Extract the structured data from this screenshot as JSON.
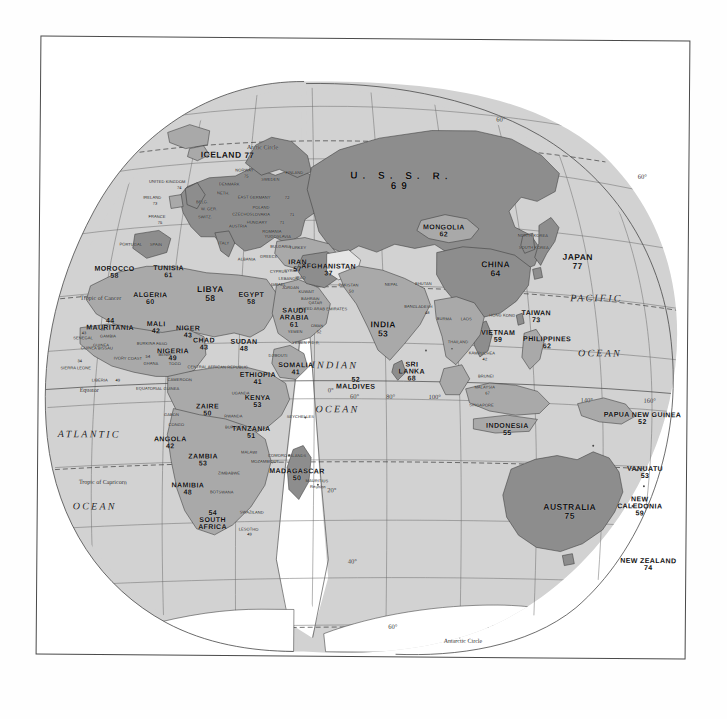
{
  "map": {
    "title": "World map of life expectancy (Eastern Hemisphere, interrupted projection)",
    "projection": "interrupted-homolosine",
    "sea_color": "#d2d2d2",
    "land_light_color": "#c0c0c0",
    "land_dark_color": "#8b8b8b",
    "line_color": "#555555",
    "page_color": "#ffffff"
  },
  "oceans": [
    {
      "name": "ATLANTIC",
      "x": 52,
      "y": 398
    },
    {
      "name": "OCEAN",
      "x": 58,
      "y": 470
    },
    {
      "name": "INDIAN",
      "x": 297,
      "y": 327
    },
    {
      "name": "OCEAN",
      "x": 300,
      "y": 371
    },
    {
      "name": "PACIFIC",
      "x": 558,
      "y": 258
    },
    {
      "name": "OCEAN",
      "x": 562,
      "y": 313
    }
  ],
  "circles": [
    {
      "name": "Tropic of Cancer",
      "x": 42,
      "y": 262
    },
    {
      "name": "Equator",
      "x": 42,
      "y": 354
    },
    {
      "name": "Tropic of Capricorn",
      "x": 42,
      "y": 446
    },
    {
      "name": "Antarctic Circle",
      "x": 408,
      "y": 602
    }
  ],
  "graticule_labels": [
    {
      "text": "60°",
      "x": 461,
      "y": 80
    },
    {
      "text": "60°",
      "x": 603,
      "y": 136
    },
    {
      "text": "40°",
      "x": 657,
      "y": 215
    },
    {
      "text": "20°",
      "x": 694,
      "y": 290
    },
    {
      "text": "180",
      "x": 683,
      "y": 363
    },
    {
      "text": "140°",
      "x": 549,
      "y": 360
    },
    {
      "text": "160°",
      "x": 612,
      "y": 360
    },
    {
      "text": "20°",
      "x": 295,
      "y": 452
    },
    {
      "text": "40°",
      "x": 316,
      "y": 523
    },
    {
      "text": "60°",
      "x": 357,
      "y": 588
    },
    {
      "text": "80°",
      "x": 393,
      "y": 645
    },
    {
      "text": "60°",
      "x": 317,
      "y": 358
    },
    {
      "text": "80°",
      "x": 353,
      "y": 358
    },
    {
      "text": "100°",
      "x": 397,
      "y": 358
    },
    {
      "text": "0°",
      "x": 293,
      "y": 352
    }
  ],
  "countries": [
    {
      "name": "ICELAND",
      "value": "77",
      "x": 188,
      "y": 118,
      "size": "big",
      "inline": true
    },
    {
      "name": "U. S. S. R.",
      "value": "69",
      "x": 362,
      "y": 143,
      "size": "ussr"
    },
    {
      "name": "MONGOLIA",
      "value": "62",
      "x": 405,
      "y": 192,
      "size": "mid"
    },
    {
      "name": "CHINA",
      "value": "64",
      "x": 457,
      "y": 230,
      "size": "big"
    },
    {
      "name": "JAPAN",
      "value": "77",
      "x": 539,
      "y": 222,
      "size": "big"
    },
    {
      "name": "TAIWAN",
      "value": "73",
      "x": 498,
      "y": 277,
      "size": "mid"
    },
    {
      "name": "AFGHANISTAN",
      "value": "37",
      "x": 290,
      "y": 232,
      "size": "mid"
    },
    {
      "name": "IRAN",
      "value": "57",
      "x": 259,
      "y": 228,
      "size": "mid"
    },
    {
      "name": "INDIA",
      "value": "53",
      "x": 345,
      "y": 291,
      "size": "big"
    },
    {
      "name": "SRI LANKA",
      "value": "68",
      "x": 374,
      "y": 333,
      "size": "mid",
      "two": true
    },
    {
      "name": "MALDIVES",
      "value": "52",
      "x": 318,
      "y": 345,
      "size": "mid",
      "rev": true
    },
    {
      "name": "VIETNAM",
      "value": "59",
      "x": 460,
      "y": 297,
      "size": "mid"
    },
    {
      "name": "PHILIPPINES",
      "value": "62",
      "x": 509,
      "y": 303,
      "size": "mid"
    },
    {
      "name": "INDONESIA",
      "value": "55",
      "x": 470,
      "y": 390,
      "size": "mid"
    },
    {
      "name": "PAPUA NEW GUINEA",
      "value": "52",
      "x": 605,
      "y": 378,
      "size": "mid"
    },
    {
      "name": "VANUATU",
      "value": "53",
      "x": 608,
      "y": 432,
      "size": "mid"
    },
    {
      "name": "FIJI",
      "value": "62",
      "x": 673,
      "y": 432,
      "size": "mid",
      "inline": true
    },
    {
      "name": "AUSTRALIA",
      "value": "75",
      "x": 533,
      "y": 472,
      "size": "big"
    },
    {
      "name": "NEW CALEDONIA",
      "value": "59",
      "x": 603,
      "y": 466,
      "size": "mid",
      "two": true
    },
    {
      "name": "NEW ZEALAND",
      "value": "74",
      "x": 612,
      "y": 524,
      "size": "mid"
    },
    {
      "name": "SAUDI ARABIA",
      "value": "61",
      "x": 256,
      "y": 280,
      "size": "mid",
      "two": true
    },
    {
      "name": "EGYPT",
      "value": "58",
      "x": 213,
      "y": 261,
      "size": "mid"
    },
    {
      "name": "LIBYA",
      "value": "58",
      "x": 172,
      "y": 257,
      "size": "big"
    },
    {
      "name": "TUNISIA",
      "value": "61",
      "x": 130,
      "y": 235,
      "size": "mid"
    },
    {
      "name": "MOROCCO",
      "value": "58",
      "x": 76,
      "y": 236,
      "size": "mid"
    },
    {
      "name": "ALGERIA",
      "value": "60",
      "x": 112,
      "y": 262,
      "size": "mid"
    },
    {
      "name": "MAURITANIA",
      "value": "44",
      "x": 72,
      "y": 288,
      "size": "mid",
      "rev": true
    },
    {
      "name": "MALI",
      "value": "42",
      "x": 118,
      "y": 291,
      "size": "mid"
    },
    {
      "name": "NIGER",
      "value": "43",
      "x": 150,
      "y": 295,
      "size": "mid"
    },
    {
      "name": "CHAD",
      "value": "43",
      "x": 166,
      "y": 307,
      "size": "mid"
    },
    {
      "name": "SUDAN",
      "value": "48",
      "x": 206,
      "y": 308,
      "size": "mid"
    },
    {
      "name": "NIGERIA",
      "value": "49",
      "x": 135,
      "y": 318,
      "size": "mid"
    },
    {
      "name": "SOMALIA",
      "value": "41",
      "x": 258,
      "y": 331,
      "size": "mid"
    },
    {
      "name": "ETHIOPIA",
      "value": "41",
      "x": 220,
      "y": 341,
      "size": "mid"
    },
    {
      "name": "KENYA",
      "value": "53",
      "x": 220,
      "y": 364,
      "size": "mid"
    },
    {
      "name": "ZAIRE",
      "value": "50",
      "x": 170,
      "y": 373,
      "size": "mid"
    },
    {
      "name": "TANZANIA",
      "value": "51",
      "x": 214,
      "y": 395,
      "size": "mid"
    },
    {
      "name": "ANGOLA",
      "value": "42",
      "x": 133,
      "y": 406,
      "size": "mid"
    },
    {
      "name": "ZAMBIA",
      "value": "53",
      "x": 166,
      "y": 423,
      "size": "mid"
    },
    {
      "name": "MADAGASCAR",
      "value": "50",
      "x": 260,
      "y": 437,
      "size": "mid"
    },
    {
      "name": "NAMIBIA",
      "value": "48",
      "x": 151,
      "y": 452,
      "size": "mid"
    },
    {
      "name": "SOUTH AFRICA",
      "value": "54",
      "x": 176,
      "y": 483,
      "size": "mid",
      "two": true,
      "rev": true
    }
  ],
  "small_labels": [
    {
      "text": "Arctic Circle",
      "x": 223,
      "y": 110,
      "cls": "circ"
    },
    {
      "text": "NORWAY",
      "x": 205,
      "y": 133,
      "cls": "tiny"
    },
    {
      "text": "75",
      "x": 207,
      "y": 139,
      "cls": "tiny"
    },
    {
      "text": "SWEDEN",
      "x": 231,
      "y": 142,
      "cls": "tiny"
    },
    {
      "text": "FINLAND",
      "x": 255,
      "y": 135,
      "cls": "tiny"
    },
    {
      "text": "UNITED KINGDOM",
      "x": 128,
      "y": 145,
      "cls": "tiny"
    },
    {
      "text": "74",
      "x": 140,
      "y": 151,
      "cls": "tiny"
    },
    {
      "text": "IRELAND",
      "x": 113,
      "y": 161,
      "cls": "tiny"
    },
    {
      "text": "73",
      "x": 116,
      "y": 167,
      "cls": "tiny"
    },
    {
      "text": "DENMARK",
      "x": 190,
      "y": 147,
      "cls": "tiny"
    },
    {
      "text": "NETH.",
      "x": 184,
      "y": 156,
      "cls": "tiny"
    },
    {
      "text": "EAST GERMANY",
      "x": 215,
      "y": 160,
      "cls": "tiny"
    },
    {
      "text": "72",
      "x": 248,
      "y": 160,
      "cls": "tiny"
    },
    {
      "text": "POLAND",
      "x": 222,
      "y": 170,
      "cls": "tiny"
    },
    {
      "text": "CZECHOSLOVAKIA",
      "x": 212,
      "y": 177,
      "cls": "tiny"
    },
    {
      "text": "71",
      "x": 253,
      "y": 177,
      "cls": "tiny"
    },
    {
      "text": "HUNGARY",
      "x": 218,
      "y": 185,
      "cls": "tiny"
    },
    {
      "text": "71",
      "x": 243,
      "y": 185,
      "cls": "tiny"
    },
    {
      "text": "ROMANIA",
      "x": 233,
      "y": 194,
      "cls": "tiny"
    },
    {
      "text": "W. GER.",
      "x": 170,
      "y": 172,
      "cls": "tiny"
    },
    {
      "text": "SWITZ.",
      "x": 166,
      "y": 180,
      "cls": "tiny"
    },
    {
      "text": "BELG.",
      "x": 163,
      "y": 165,
      "cls": "tiny"
    },
    {
      "text": "AUSTRIA",
      "x": 199,
      "y": 189,
      "cls": "tiny"
    },
    {
      "text": "FRANCE",
      "x": 118,
      "y": 180,
      "cls": "tiny"
    },
    {
      "text": "75",
      "x": 121,
      "y": 186,
      "cls": "tiny"
    },
    {
      "text": "PORTUGAL",
      "x": 92,
      "y": 208,
      "cls": "tiny"
    },
    {
      "text": "SPAIN",
      "x": 117,
      "y": 208,
      "cls": "tiny"
    },
    {
      "text": "ITALY",
      "x": 185,
      "y": 206,
      "cls": "tiny"
    },
    {
      "text": "ALBANIA",
      "x": 208,
      "y": 222,
      "cls": "tiny"
    },
    {
      "text": "BULGARIA",
      "x": 242,
      "y": 209,
      "cls": "tiny"
    },
    {
      "text": "YUGOSLAVIA",
      "x": 239,
      "y": 199,
      "cls": "tiny"
    },
    {
      "text": "GREECE",
      "x": 230,
      "y": 219,
      "cls": "tiny"
    },
    {
      "text": "CYPRUS",
      "x": 240,
      "y": 234,
      "cls": "tiny"
    },
    {
      "text": "TURKEY",
      "x": 259,
      "y": 210,
      "cls": "tiny"
    },
    {
      "text": "SYRIA",
      "x": 252,
      "y": 233,
      "cls": "tiny"
    },
    {
      "text": "IRAQ",
      "x": 262,
      "y": 240,
      "cls": "tiny"
    },
    {
      "text": "LEBANON",
      "x": 250,
      "y": 241,
      "cls": "tiny"
    },
    {
      "text": "ISRAEL",
      "x": 240,
      "y": 247,
      "cls": "tiny"
    },
    {
      "text": "JORDAN",
      "x": 252,
      "y": 250,
      "cls": "tiny"
    },
    {
      "text": "KUWAIT",
      "x": 268,
      "y": 254,
      "cls": "tiny"
    },
    {
      "text": "QATAR",
      "x": 277,
      "y": 265,
      "cls": "tiny"
    },
    {
      "text": "BAHRAIN",
      "x": 272,
      "y": 261,
      "cls": "tiny"
    },
    {
      "text": "UNITED ARAB EMIRATES",
      "x": 284,
      "y": 271,
      "cls": "tiny"
    },
    {
      "text": "OMAN",
      "x": 279,
      "y": 288,
      "cls": "tiny"
    },
    {
      "text": "52",
      "x": 281,
      "y": 294,
      "cls": "tiny"
    },
    {
      "text": "YEMEN",
      "x": 257,
      "y": 294,
      "cls": "tiny"
    },
    {
      "text": "YEMEN P.D.R.",
      "x": 268,
      "y": 305,
      "cls": "tiny"
    },
    {
      "text": "DJIBOUTI",
      "x": 240,
      "y": 318,
      "cls": "tiny"
    },
    {
      "text": "PAKISTAN",
      "x": 310,
      "y": 247,
      "cls": "tiny"
    },
    {
      "text": "50",
      "x": 313,
      "y": 253,
      "cls": "tiny"
    },
    {
      "text": "NEPAL",
      "x": 353,
      "y": 246,
      "cls": "tiny"
    },
    {
      "text": "BHUTAN",
      "x": 385,
      "y": 245,
      "cls": "tiny"
    },
    {
      "text": "BANGLADESH",
      "x": 380,
      "y": 268,
      "cls": "tiny"
    },
    {
      "text": "48",
      "x": 389,
      "y": 274,
      "cls": "tiny"
    },
    {
      "text": "BURMA",
      "x": 406,
      "y": 280,
      "cls": "tiny"
    },
    {
      "text": "LAOS",
      "x": 428,
      "y": 280,
      "cls": "tiny"
    },
    {
      "text": "THAILAND",
      "x": 420,
      "y": 303,
      "cls": "tiny"
    },
    {
      "text": "KAMPUCHEA",
      "x": 444,
      "y": 314,
      "cls": "tiny"
    },
    {
      "text": "42",
      "x": 447,
      "y": 320,
      "cls": "tiny"
    },
    {
      "text": "MALAYSIA",
      "x": 447,
      "y": 348,
      "cls": "tiny"
    },
    {
      "text": "67",
      "x": 450,
      "y": 354,
      "cls": "tiny"
    },
    {
      "text": "BRUNEI",
      "x": 448,
      "y": 337,
      "cls": "tiny"
    },
    {
      "text": "SINGAPORE",
      "x": 444,
      "y": 366,
      "cls": "tiny"
    },
    {
      "text": "NORTH KOREA",
      "x": 494,
      "y": 196,
      "cls": "tiny"
    },
    {
      "text": "SOUTH KOREA",
      "x": 495,
      "y": 208,
      "cls": "tiny"
    },
    {
      "text": "HONG KONG",
      "x": 464,
      "y": 276,
      "cls": "tiny"
    },
    {
      "text": "SENEGAL",
      "x": 45,
      "y": 302,
      "cls": "tiny"
    },
    {
      "text": "43",
      "x": 46,
      "y": 297,
      "cls": "tiny"
    },
    {
      "text": "GAMBIA",
      "x": 70,
      "y": 300,
      "cls": "tiny"
    },
    {
      "text": "36",
      "x": 65,
      "y": 293,
      "cls": "tiny"
    },
    {
      "text": "GUINEA BISSAU",
      "x": 59,
      "y": 312,
      "cls": "tiny"
    },
    {
      "text": "GUINEA",
      "x": 63,
      "y": 309,
      "cls": "tiny"
    },
    {
      "text": "SIERRA LEONE",
      "x": 38,
      "y": 332,
      "cls": "tiny"
    },
    {
      "text": "34",
      "x": 42,
      "y": 325,
      "cls": "tiny"
    },
    {
      "text": "LIBERIA",
      "x": 62,
      "y": 344,
      "cls": "tiny"
    },
    {
      "text": "49",
      "x": 80,
      "y": 344,
      "cls": "tiny"
    },
    {
      "text": "IVORY COAST",
      "x": 90,
      "y": 322,
      "cls": "tiny"
    },
    {
      "text": "GHANA",
      "x": 113,
      "y": 327,
      "cls": "tiny"
    },
    {
      "text": "54",
      "x": 110,
      "y": 320,
      "cls": "tiny"
    },
    {
      "text": "BURKINA FASO",
      "x": 114,
      "y": 307,
      "cls": "tiny"
    },
    {
      "text": "BENIN",
      "x": 127,
      "y": 318,
      "cls": "tiny"
    },
    {
      "text": "TOGO",
      "x": 137,
      "y": 327,
      "cls": "tiny"
    },
    {
      "text": "EQUATORIAL GUINEA",
      "x": 120,
      "y": 352,
      "cls": "tiny"
    },
    {
      "text": "CAMEROON",
      "x": 142,
      "y": 343,
      "cls": "tiny"
    },
    {
      "text": "GABON",
      "x": 134,
      "y": 378,
      "cls": "tiny"
    },
    {
      "text": "CONGO",
      "x": 139,
      "y": 388,
      "cls": "tiny"
    },
    {
      "text": "CENTRAL AFRICAN REPUBLIC",
      "x": 180,
      "y": 330,
      "cls": "tiny"
    },
    {
      "text": "UGANDA",
      "x": 203,
      "y": 356,
      "cls": "tiny"
    },
    {
      "text": "RWANDA",
      "x": 196,
      "y": 379,
      "cls": "tiny"
    },
    {
      "text": "BURUNDI",
      "x": 197,
      "y": 390,
      "cls": "tiny"
    },
    {
      "text": "MALAWI",
      "x": 212,
      "y": 415,
      "cls": "tiny"
    },
    {
      "text": "MOZAMBIQUE",
      "x": 228,
      "y": 424,
      "cls": "tiny"
    },
    {
      "text": "ZIMBABWE",
      "x": 192,
      "y": 436,
      "cls": "tiny"
    },
    {
      "text": "BOTSWANA",
      "x": 185,
      "y": 455,
      "cls": "tiny"
    },
    {
      "text": "SWAZILAND",
      "x": 215,
      "y": 475,
      "cls": "tiny"
    },
    {
      "text": "LESOTHO",
      "x": 212,
      "y": 492,
      "cls": "tiny"
    },
    {
      "text": "49",
      "x": 213,
      "y": 497,
      "cls": "tiny"
    },
    {
      "text": "MAURITIUS",
      "x": 280,
      "y": 443,
      "cls": "tiny"
    },
    {
      "text": "COMORO ISLANDS",
      "x": 250,
      "y": 418,
      "cls": "tiny"
    },
    {
      "text": "SEYCHELLES",
      "x": 263,
      "y": 379,
      "cls": "tiny"
    },
    {
      "text": "Reunion",
      "x": 281,
      "y": 449,
      "cls": "tiny"
    }
  ]
}
